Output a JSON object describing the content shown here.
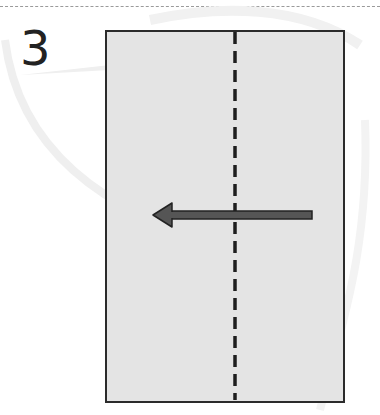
{
  "step": {
    "number": "3"
  },
  "diagram": {
    "paper": {
      "fill": "#e4e4e4",
      "stroke": "#2b2b2b"
    },
    "fold_line": {
      "style": "dashed",
      "color": "#1e1e1e",
      "orientation": "vertical",
      "position": "center"
    },
    "arrow": {
      "direction": "left",
      "color": "#555555",
      "outline": "#222222"
    },
    "top_rule": {
      "style": "dashed",
      "color": "#9a9a9a"
    },
    "watermark": {
      "color": "#f0f0f0"
    }
  }
}
